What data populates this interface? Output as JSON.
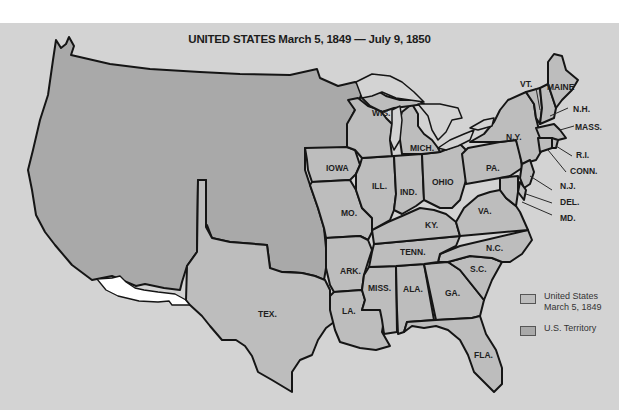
{
  "map": {
    "title": "UNITED STATES March 5, 1849 — July 9, 1850",
    "colors": {
      "background": "#d3d3d3",
      "state": "#bdbdbd",
      "territory": "#a9a9a9",
      "lakes": "#d3d3d3",
      "unorganized": "#ffffff",
      "border": "#151515"
    },
    "state_labels": [
      {
        "id": "wis",
        "text": "WIS."
      },
      {
        "id": "mich",
        "text": "MICH."
      },
      {
        "id": "iowa",
        "text": "IOWA"
      },
      {
        "id": "ill",
        "text": "ILL."
      },
      {
        "id": "ind",
        "text": "IND."
      },
      {
        "id": "ohio",
        "text": "OHIO"
      },
      {
        "id": "pa",
        "text": "PA."
      },
      {
        "id": "ny",
        "text": "N.Y."
      },
      {
        "id": "vt",
        "text": "VT."
      },
      {
        "id": "maine",
        "text": "MAINE"
      },
      {
        "id": "nh",
        "text": "N.H."
      },
      {
        "id": "mass",
        "text": "MASS."
      },
      {
        "id": "ri",
        "text": "R.I."
      },
      {
        "id": "conn",
        "text": "CONN."
      },
      {
        "id": "nj",
        "text": "N.J."
      },
      {
        "id": "del",
        "text": "DEL."
      },
      {
        "id": "md",
        "text": "MD."
      },
      {
        "id": "mo",
        "text": "MO."
      },
      {
        "id": "ky",
        "text": "KY."
      },
      {
        "id": "va",
        "text": "VA."
      },
      {
        "id": "tenn",
        "text": "TENN."
      },
      {
        "id": "nc",
        "text": "N.C."
      },
      {
        "id": "ark",
        "text": "ARK."
      },
      {
        "id": "sc",
        "text": "S.C."
      },
      {
        "id": "miss",
        "text": "MISS."
      },
      {
        "id": "ala",
        "text": "ALA."
      },
      {
        "id": "ga",
        "text": "GA."
      },
      {
        "id": "tex",
        "text": "TEX."
      },
      {
        "id": "la",
        "text": "LA."
      },
      {
        "id": "fla",
        "text": "FLA."
      }
    ]
  },
  "legend": {
    "items": [
      {
        "label_line1": "United States",
        "label_line2": "March 5, 1849",
        "color": "#bdbdbd"
      },
      {
        "label_line1": "U.S. Territory",
        "label_line2": "",
        "color": "#a9a9a9"
      }
    ]
  }
}
